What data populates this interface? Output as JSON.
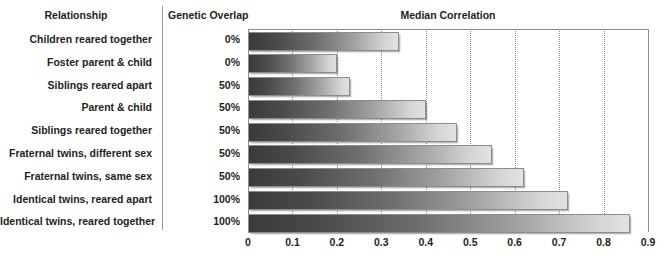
{
  "headers": {
    "relationship": "Relationship",
    "genetic_overlap": "Genetic Overlap",
    "median_correlation": "Median Correlation"
  },
  "chart_data": {
    "type": "bar",
    "orientation": "horizontal",
    "title": "Median Correlation",
    "xlabel": "",
    "ylabel": "Relationship",
    "xlim": [
      0,
      0.9
    ],
    "grid": true,
    "legend": false,
    "tick_labels": [
      "0",
      "0.1",
      "0.2",
      "0.3",
      "0.4",
      "0.5",
      "0.6",
      "0.7",
      "0.8",
      "0.9"
    ],
    "ticks": [
      0,
      0.1,
      0.2,
      0.3,
      0.4,
      0.5,
      0.6,
      0.7,
      0.8,
      0.9
    ],
    "categories": [
      "Children reared together",
      "Foster parent & child",
      "Siblings reared apart",
      "Parent & child",
      "Siblings reared together",
      "Fraternal twins, different sex",
      "Fraternal twins, same sex",
      "Identical twins, reared apart",
      "Identical twins, reared together"
    ],
    "values": [
      0.34,
      0.2,
      0.23,
      0.4,
      0.47,
      0.55,
      0.62,
      0.72,
      0.86
    ],
    "genetic_overlap": [
      "0%",
      "0%",
      "50%",
      "50%",
      "50%",
      "50%",
      "50%",
      "100%",
      "100%"
    ],
    "bar_gradient_from": "#3a3a3a",
    "bar_gradient_to": "#e2e2e2",
    "bar_border_color": "#8c8c8c",
    "axis_color": "#8e8e8e",
    "text_color": "#231f20"
  }
}
